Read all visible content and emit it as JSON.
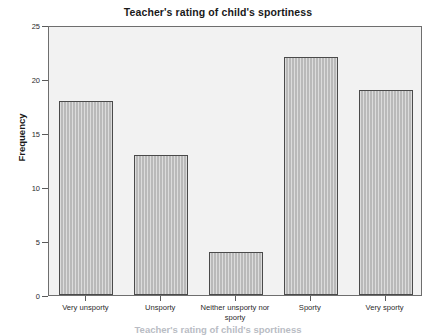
{
  "chart_data": {
    "type": "bar",
    "title": "Teacher's rating of child's sportiness",
    "xlabel": "Teacher's rating of child's sportiness",
    "ylabel": "Frequency",
    "categories": [
      "Very unsporty",
      "Unsporty",
      "Neither unsporty nor sporty",
      "Sporty",
      "Very sporty"
    ],
    "values": [
      18,
      13,
      4,
      22,
      19
    ],
    "ylim": [
      0,
      25
    ],
    "yticks": [
      0,
      5,
      10,
      15,
      20,
      25
    ],
    "ytick_labels": [
      "0",
      "5",
      "10",
      "15",
      "20",
      "25"
    ],
    "grid": false,
    "legend": null,
    "bar_fill_color": "#b9b9b9",
    "bar_border_color": "#4a4a4a",
    "plot_background_color": "#f2f2f2",
    "frame_color": "#6e6e6e"
  }
}
